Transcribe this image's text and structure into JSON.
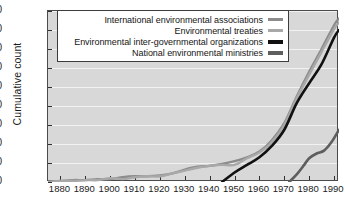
{
  "chart_data": {
    "type": "line",
    "title": "",
    "xlabel": "",
    "ylabel": "Cumulative count",
    "xlim": [
      1875,
      1992
    ],
    "ylim": [
      0,
      180
    ],
    "yticks": [
      0,
      20,
      40,
      60,
      80,
      100,
      120,
      140,
      160,
      180
    ],
    "xticks": [
      1880,
      1890,
      1900,
      1910,
      1920,
      1930,
      1940,
      1950,
      1960,
      1970,
      1980,
      1990
    ],
    "grid": "horizontal",
    "legend_position": "top-center",
    "series": [
      {
        "name": "International environmental associations",
        "color": "#8c8c8c",
        "x": [
          1875,
          1880,
          1885,
          1890,
          1895,
          1900,
          1905,
          1910,
          1915,
          1920,
          1925,
          1930,
          1935,
          1940,
          1945,
          1950,
          1955,
          1960,
          1965,
          1970,
          1975,
          1980,
          1985,
          1990,
          1992
        ],
        "values": [
          0,
          1,
          2,
          2,
          3,
          3,
          5,
          6,
          6,
          7,
          9,
          13,
          16,
          17,
          19,
          22,
          26,
          32,
          44,
          62,
          90,
          116,
          140,
          165,
          172
        ]
      },
      {
        "name": "Environmental treaties",
        "color": "#a8a8a8",
        "x": [
          1875,
          1880,
          1885,
          1890,
          1895,
          1900,
          1905,
          1910,
          1915,
          1920,
          1925,
          1930,
          1935,
          1940,
          1945,
          1950,
          1955,
          1960,
          1965,
          1970,
          1975,
          1980,
          1985,
          1990,
          1992
        ],
        "values": [
          0,
          1,
          1,
          2,
          2,
          4,
          3,
          5,
          6,
          6,
          9,
          12,
          15,
          17,
          18,
          18,
          25,
          31,
          42,
          60,
          88,
          113,
          137,
          161,
          168
        ]
      },
      {
        "name": "Environmental inter-governmental organizations",
        "color": "#111111",
        "x": [
          1945,
          1950,
          1955,
          1960,
          1965,
          1970,
          1975,
          1980,
          1985,
          1990,
          1992
        ],
        "values": [
          0,
          10,
          18,
          26,
          38,
          55,
          83,
          104,
          124,
          152,
          160
        ]
      },
      {
        "name": "National environmental ministries",
        "color": "#5e5e5e",
        "x": [
          1972,
          1975,
          1978,
          1980,
          1983,
          1986,
          1989,
          1992
        ],
        "values": [
          0,
          8,
          18,
          25,
          30,
          33,
          42,
          55
        ]
      }
    ]
  },
  "legend": {
    "items": [
      {
        "label": "International environmental associations",
        "color": "#8c8c8c",
        "thickness": 3
      },
      {
        "label": "Environmental treaties",
        "color": "#a8a8a8",
        "thickness": 3
      },
      {
        "label": "Environmental inter-governmental organizations",
        "color": "#111111",
        "thickness": 4
      },
      {
        "label": "National environmental ministries",
        "color": "#5e5e5e",
        "thickness": 4
      }
    ]
  }
}
